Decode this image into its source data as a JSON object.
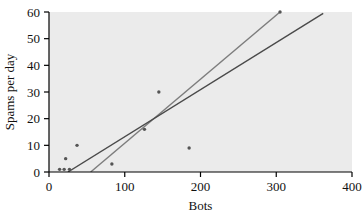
{
  "chart_data": {
    "type": "scatter",
    "title": "",
    "xlabel": "Bots",
    "ylabel": "Spams per day",
    "xlim": [
      0,
      400
    ],
    "ylim": [
      0,
      60
    ],
    "xticks": [
      0,
      100,
      200,
      300,
      400
    ],
    "xtick_labels": [
      "0",
      "100",
      "200",
      "300",
      "400"
    ],
    "yticks": [
      0,
      10,
      20,
      30,
      40,
      50,
      60
    ],
    "ytick_labels": [
      "0",
      "10",
      "20",
      "30",
      "40",
      "50",
      "60"
    ],
    "grid": false,
    "legend": null,
    "plot_background": "#ebebeb",
    "figure_background": "#ffffff",
    "point_color": "#555555",
    "points": [
      {
        "x": 14,
        "y": 1
      },
      {
        "x": 20,
        "y": 1
      },
      {
        "x": 22,
        "y": 5
      },
      {
        "x": 27,
        "y": 1
      },
      {
        "x": 37,
        "y": 10
      },
      {
        "x": 83,
        "y": 3
      },
      {
        "x": 126,
        "y": 16
      },
      {
        "x": 145,
        "y": 30
      },
      {
        "x": 185,
        "y": 9
      },
      {
        "x": 305,
        "y": 60
      }
    ],
    "series": [
      {
        "name": "fit-line-gray",
        "type": "line",
        "color": "#7d7d7d",
        "x": [
          55,
          305
        ],
        "y": [
          0,
          60
        ]
      },
      {
        "name": "fit-line-dark",
        "type": "line",
        "color": "#4a4a4a",
        "x": [
          25,
          362
        ],
        "y": [
          0,
          59.5
        ]
      }
    ]
  },
  "axes": {
    "x_axis_name": "bots-axis",
    "y_axis_name": "spams-per-day-axis"
  }
}
